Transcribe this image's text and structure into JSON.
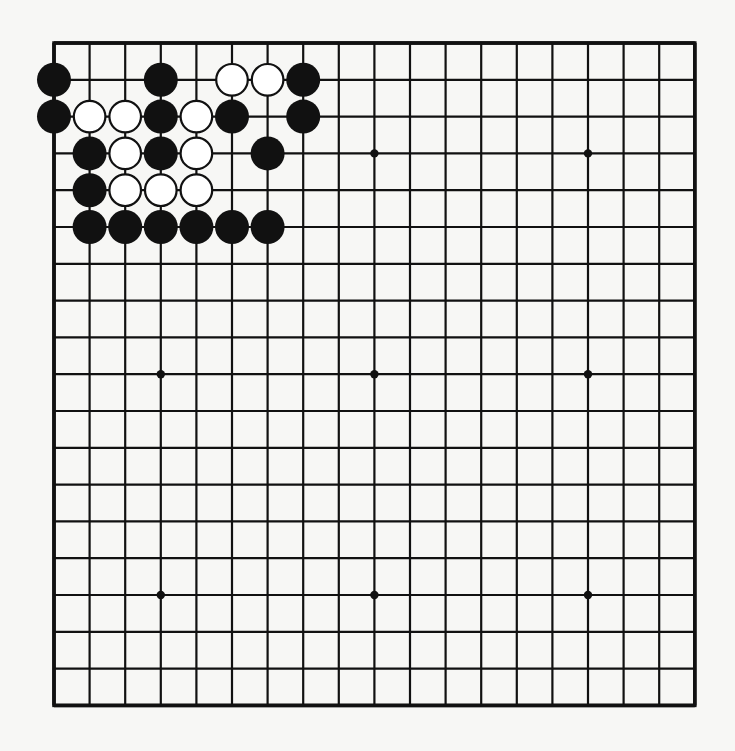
{
  "board": {
    "size": 19,
    "origin_x": 54,
    "origin_y": 43,
    "spacing_x": 35.6,
    "spacing_y": 36.8,
    "line_color": "#111111",
    "background": "#f7f7f5",
    "star_points": [
      [
        4,
        4
      ],
      [
        4,
        10
      ],
      [
        4,
        16
      ],
      [
        10,
        4
      ],
      [
        10,
        10
      ],
      [
        10,
        16
      ],
      [
        16,
        4
      ],
      [
        16,
        10
      ],
      [
        16,
        16
      ]
    ],
    "stones": [
      {
        "row": 2,
        "col": 1,
        "color": "black"
      },
      {
        "row": 2,
        "col": 4,
        "color": "black"
      },
      {
        "row": 2,
        "col": 6,
        "color": "white"
      },
      {
        "row": 2,
        "col": 7,
        "color": "white"
      },
      {
        "row": 2,
        "col": 8,
        "color": "black"
      },
      {
        "row": 3,
        "col": 1,
        "color": "black"
      },
      {
        "row": 3,
        "col": 2,
        "color": "white"
      },
      {
        "row": 3,
        "col": 3,
        "color": "white"
      },
      {
        "row": 3,
        "col": 4,
        "color": "black"
      },
      {
        "row": 3,
        "col": 5,
        "color": "white"
      },
      {
        "row": 3,
        "col": 6,
        "color": "black"
      },
      {
        "row": 3,
        "col": 8,
        "color": "black"
      },
      {
        "row": 4,
        "col": 2,
        "color": "black"
      },
      {
        "row": 4,
        "col": 3,
        "color": "white"
      },
      {
        "row": 4,
        "col": 4,
        "color": "black"
      },
      {
        "row": 4,
        "col": 5,
        "color": "white"
      },
      {
        "row": 4,
        "col": 7,
        "color": "black"
      },
      {
        "row": 5,
        "col": 2,
        "color": "black"
      },
      {
        "row": 5,
        "col": 3,
        "color": "white"
      },
      {
        "row": 5,
        "col": 4,
        "color": "white"
      },
      {
        "row": 5,
        "col": 5,
        "color": "white"
      },
      {
        "row": 6,
        "col": 2,
        "color": "black"
      },
      {
        "row": 6,
        "col": 3,
        "color": "black"
      },
      {
        "row": 6,
        "col": 4,
        "color": "black"
      },
      {
        "row": 6,
        "col": 5,
        "color": "black"
      },
      {
        "row": 6,
        "col": 6,
        "color": "black"
      },
      {
        "row": 6,
        "col": 7,
        "color": "black"
      }
    ]
  }
}
